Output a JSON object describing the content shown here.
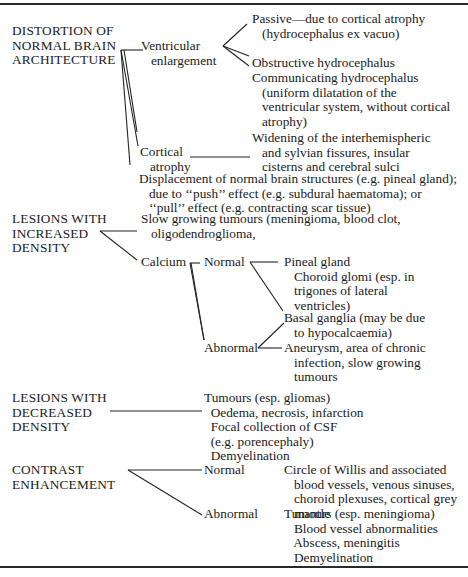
{
  "categories": [
    {
      "label": "DISTORTION OF\nNORMAL BRAIN\nARCHITECTURE",
      "branches": [
        {
          "label": "Ventricular\n   enlargement",
          "items": [
            "Passive—due to cortical atrophy\n   (hydrocephalus ex vacuo)",
            "Obstructive hydrocephalus",
            "Communicating hydrocephalus\n   (uniform dilatation of the\n   ventricular system, without cortical\n   atrophy)"
          ]
        },
        {
          "label": "Cortical\n   atrophy",
          "items": [
            "Widening of the interhemispheric\n   and sylvian fissures, insular\n   cisterns and cerebral sulci"
          ]
        },
        {
          "label": "",
          "items": [
            "Displacement of normal brain structures (e.g. pineal gland);\n   due to ‘‘push’’ effect (e.g. subdural haematoma); or\n   ‘‘pull’’ effect (e.g. contracting scar tissue)"
          ]
        }
      ]
    },
    {
      "label": "LESIONS WITH\nINCREASED\nDENSITY",
      "branches": [
        {
          "label": "",
          "items": [
            "Slow growing tumours (meningioma, blood clot,\n   oligodendroglioma,"
          ]
        },
        {
          "label": "Calcium",
          "sub": [
            {
              "label": "Normal",
              "items": [
                "Pineal gland\n   Choroid glomi (esp. in\n   trigones of lateral\n   ventricles)"
              ]
            },
            {
              "label": "Abnormal",
              "items": [
                "Basal ganglia (may be due\n   to hypocalcaemia)",
                "Aneurysm, area of chronic\n   infection, slow growing\n   tumours"
              ]
            }
          ]
        }
      ]
    },
    {
      "label": "LESIONS WITH\nDECREASED\nDENSITY",
      "branches": [
        {
          "label": "",
          "items": [
            "Tumours (esp. gliomas)\n  Oedema, necrosis, infarction\n  Focal collection of CSF\n  (e.g. porencephaly)\n  Demyelination"
          ]
        }
      ]
    },
    {
      "label": "CONTRAST\nENHANCEMENT",
      "branches": [
        {
          "label": "Normal",
          "items": [
            "Circle of Willis and associated\n   blood vessels, venous sinuses,\n   choroid plexuses, cortical grey\n   mantle"
          ]
        },
        {
          "label": "Abnormal",
          "items": [
            "Tumours (esp. meningioma)\n   Blood vessel abnormalities\n   Abscess, meningitis\n   Demyelination"
          ]
        }
      ]
    }
  ]
}
